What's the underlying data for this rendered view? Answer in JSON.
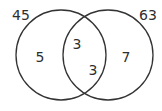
{
  "diagram": {
    "type": "venn",
    "stroke_color": "#333333",
    "text_color": "#2e2e2e",
    "sets": [
      {
        "id": "left",
        "label": "45",
        "only_value": "5"
      },
      {
        "id": "right",
        "label": "63",
        "only_value": "7"
      }
    ],
    "intersection": {
      "values": [
        "3",
        "3"
      ]
    }
  }
}
